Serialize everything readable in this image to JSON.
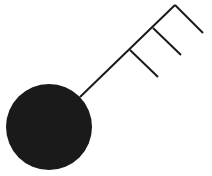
{
  "figure": {
    "colors": {
      "fill": "#1a1a1a",
      "stroke": "#1a1a1a",
      "background": "#ffffff"
    },
    "circle": {
      "cx": 49,
      "cy": 127,
      "r": 43
    },
    "shaft": {
      "x1": 80,
      "y1": 97,
      "x2": 175,
      "y2": 5
    },
    "teeth": [
      {
        "x1": 175,
        "y1": 5,
        "x2": 203,
        "y2": 33
      },
      {
        "x1": 153,
        "y1": 28,
        "x2": 181,
        "y2": 55
      },
      {
        "x1": 130,
        "y1": 50,
        "x2": 158,
        "y2": 77
      }
    ]
  }
}
